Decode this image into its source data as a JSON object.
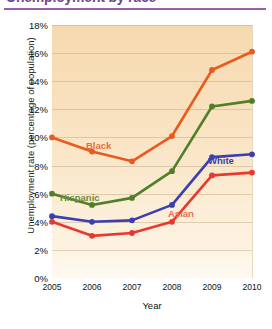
{
  "title": {
    "text": "Unemployment by race",
    "rule_color": "#9b5fa8"
  },
  "chart_data": {
    "type": "line",
    "title": "Unemployment by race",
    "xlabel": "Year",
    "ylabel": "Unemployment rate (percentage of population)",
    "categories": [
      "2005",
      "2006",
      "2007",
      "2008",
      "2009",
      "2010"
    ],
    "x": [
      2005,
      2006,
      2007,
      2008,
      2009,
      2010
    ],
    "xlim": [
      2005,
      2010
    ],
    "ylim": [
      0,
      18
    ],
    "ytick_labels": [
      "0%",
      "2%",
      "4%",
      "6%",
      "8%",
      "10%",
      "12%",
      "14%",
      "16%",
      "18%"
    ],
    "ytick_values": [
      0,
      2,
      4,
      6,
      8,
      10,
      12,
      14,
      16,
      18
    ],
    "grid": true,
    "legend_position": "inline-labels",
    "series": [
      {
        "name": "Black",
        "color": "#ea5a20",
        "label_color": "#e2713c",
        "values": [
          10.0,
          9.0,
          8.3,
          10.1,
          14.8,
          16.1
        ]
      },
      {
        "name": "Hispanic",
        "color": "#4f7f28",
        "label_color": "#6f8a3c",
        "values": [
          6.0,
          5.2,
          5.7,
          7.6,
          12.2,
          12.6
        ]
      },
      {
        "name": "White",
        "color": "#3b3fb0",
        "label_color": "#3b3fb0",
        "values": [
          4.4,
          4.0,
          4.1,
          5.2,
          8.6,
          8.8
        ]
      },
      {
        "name": "Asian",
        "color": "#e8392f",
        "label_color": "#ef6a52",
        "values": [
          4.0,
          3.0,
          3.2,
          4.0,
          7.3,
          7.5
        ]
      }
    ]
  },
  "axes": {
    "x_title": "Year",
    "y_title": "Unemployment rate (percentage of population)"
  }
}
